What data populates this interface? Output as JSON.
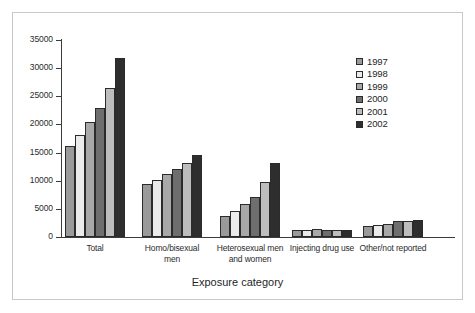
{
  "chart_data": {
    "type": "bar",
    "title": "",
    "xlabel": "Exposure category",
    "ylabel": "",
    "ylim": [
      0,
      35000
    ],
    "yticks": [
      0,
      5000,
      10000,
      15000,
      20000,
      25000,
      30000,
      35000
    ],
    "ytick_labels": [
      "0",
      "5000",
      "10000",
      "15000",
      "20000",
      "25000",
      "30000",
      "35000"
    ],
    "grid": false,
    "legend_position": "upper right",
    "categories": [
      "Total",
      "Homo/bisexual men",
      "Heterosexual men and women",
      "Injecting drug use",
      "Other/not reported"
    ],
    "category_lines": [
      [
        "Total"
      ],
      [
        "Homo/bisexual",
        "men"
      ],
      [
        "Heterosexual men",
        "and women"
      ],
      [
        "Injecting drug use"
      ],
      [
        "Other/not reported"
      ]
    ],
    "series": [
      {
        "name": "1997",
        "color": "#9a9a9a",
        "values": [
          16200,
          9350,
          3750,
          1250,
          1950
        ]
      },
      {
        "name": "1998",
        "color": "#ebebeb",
        "values": [
          18050,
          10150,
          4650,
          1300,
          2150
        ]
      },
      {
        "name": "1999",
        "color": "#a8a8a8",
        "values": [
          20400,
          11150,
          5900,
          1500,
          2400
        ]
      },
      {
        "name": "2000",
        "color": "#6e6e6e",
        "values": [
          22900,
          12100,
          7150,
          1300,
          2800
        ]
      },
      {
        "name": "2001",
        "color": "#bdbdbd",
        "values": [
          26400,
          13100,
          9750,
          1250,
          2800
        ]
      },
      {
        "name": "2002",
        "color": "#2e2e2e",
        "values": [
          31800,
          14600,
          13200,
          1300,
          3050
        ]
      }
    ]
  },
  "legend": {
    "entries": [
      "1997",
      "1998",
      "1999",
      "2000",
      "2001",
      "2002"
    ]
  }
}
